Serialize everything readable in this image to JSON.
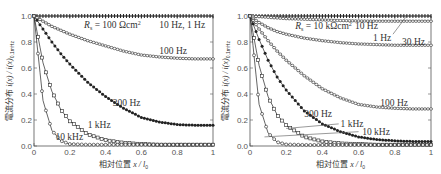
{
  "chart_data": [
    {
      "type": "line",
      "panel": "left",
      "annotation": "R_s = 100 Ωcm²",
      "xlabel": "相対位置 x / l_0",
      "ylabel": "電流分布 i(x) / i(x)_{0.1mHz}",
      "xlim": [
        0,
        1
      ],
      "ylim": [
        0,
        1.0
      ],
      "xticks": [
        "0",
        "0.2",
        "0.4",
        "0.6",
        "0.8",
        "1"
      ],
      "yticks": [
        "0.0",
        "0.2",
        "0.4",
        "0.6",
        "0.8",
        "1.0"
      ],
      "x": [
        0,
        0.05,
        0.1,
        0.15,
        0.2,
        0.3,
        0.4,
        0.5,
        0.6,
        0.7,
        0.8,
        0.9,
        1.0
      ],
      "series": [
        {
          "name": "10 Hz, 1 Hz",
          "marker": "plus",
          "values": [
            1.0,
            1.0,
            1.0,
            1.0,
            1.0,
            1.0,
            1.0,
            1.0,
            1.0,
            1.0,
            1.0,
            1.0,
            1.0
          ]
        },
        {
          "name": "100 Hz",
          "marker": "diamond-open",
          "values": [
            1.0,
            0.96,
            0.92,
            0.89,
            0.86,
            0.81,
            0.77,
            0.73,
            0.7,
            0.685,
            0.675,
            0.67,
            0.67
          ]
        },
        {
          "name": "300 Hz",
          "marker": "circle-filled",
          "values": [
            1.0,
            0.9,
            0.8,
            0.71,
            0.63,
            0.49,
            0.38,
            0.29,
            0.22,
            0.185,
            0.165,
            0.16,
            0.16
          ]
        },
        {
          "name": "1 kHz",
          "marker": "square-open",
          "values": [
            1.0,
            0.64,
            0.42,
            0.28,
            0.19,
            0.09,
            0.045,
            0.025,
            0.015,
            0.01,
            0.01,
            0.01,
            0.01
          ]
        },
        {
          "name": "10 kHz",
          "marker": "circle-open",
          "values": [
            1.0,
            0.35,
            0.12,
            0.04,
            0.015,
            0.01,
            0.01,
            0.01,
            0.01,
            0.01,
            0.01,
            0.01,
            0.01
          ]
        }
      ],
      "labels": [
        {
          "text": "R_s = 100 Ωcm²",
          "x": 0.28,
          "y": 0.93
        },
        {
          "text": "10 Hz, 1 Hz",
          "x": 0.7,
          "y": 0.93
        },
        {
          "text": "100 Hz",
          "x": 0.7,
          "y": 0.73
        },
        {
          "text": "300 Hz",
          "x": 0.44,
          "y": 0.33
        },
        {
          "text": "1 kHz",
          "x": 0.3,
          "y": 0.16
        },
        {
          "text": "10 kHz",
          "x": 0.12,
          "y": 0.07
        }
      ]
    },
    {
      "type": "line",
      "panel": "right",
      "annotation": "R_s = 10 kΩcm²",
      "xlabel": "相対位置 x / l_0",
      "ylabel": "電流分布 i(x) / i(x)_{0.1mHz}",
      "xlim": [
        0,
        1
      ],
      "ylim": [
        0,
        1.0
      ],
      "xticks": [
        "0",
        "0.2",
        "0.4",
        "0.6",
        "0.8",
        "1"
      ],
      "yticks": [
        "0.0",
        "0.2",
        "0.4",
        "0.6",
        "0.8",
        "1.0"
      ],
      "x": [
        0,
        0.05,
        0.1,
        0.15,
        0.2,
        0.3,
        0.4,
        0.5,
        0.6,
        0.7,
        0.8,
        0.9,
        1.0
      ],
      "series": [
        {
          "name": "10 Hz",
          "marker": "plus",
          "values": [
            1.0,
            1.0,
            1.0,
            1.0,
            1.0,
            1.0,
            1.0,
            1.0,
            1.0,
            1.0,
            1.0,
            1.0,
            1.0
          ]
        },
        {
          "name": "1 Hz",
          "marker": "diamond-open",
          "values": [
            1.0,
            0.995,
            0.99,
            0.985,
            0.98,
            0.975,
            0.97,
            0.965,
            0.962,
            0.96,
            0.96,
            0.96,
            0.96
          ]
        },
        {
          "name": "30 Hz",
          "marker": "diamond-open",
          "values": [
            1.0,
            0.95,
            0.91,
            0.88,
            0.86,
            0.83,
            0.81,
            0.795,
            0.785,
            0.78,
            0.775,
            0.775,
            0.775
          ]
        },
        {
          "name": "100 Hz",
          "marker": "diamond-open",
          "values": [
            1.0,
            0.9,
            0.81,
            0.73,
            0.66,
            0.54,
            0.44,
            0.37,
            0.32,
            0.3,
            0.29,
            0.285,
            0.285
          ]
        },
        {
          "name": "300 Hz",
          "marker": "circle-filled",
          "values": [
            1.0,
            0.82,
            0.66,
            0.53,
            0.43,
            0.27,
            0.17,
            0.11,
            0.07,
            0.05,
            0.04,
            0.035,
            0.035
          ]
        },
        {
          "name": "1 kHz",
          "marker": "square-open",
          "values": [
            1.0,
            0.62,
            0.38,
            0.24,
            0.16,
            0.07,
            0.035,
            0.02,
            0.015,
            0.01,
            0.01,
            0.01,
            0.01
          ]
        },
        {
          "name": "10 kHz",
          "marker": "circle-open",
          "values": [
            1.0,
            0.32,
            0.1,
            0.03,
            0.012,
            0.008,
            0.008,
            0.008,
            0.008,
            0.008,
            0.008,
            0.008,
            0.008
          ]
        }
      ],
      "labels": [
        {
          "text": "R_s = 10 kΩcm²",
          "x": 0.25,
          "y": 0.92
        },
        {
          "text": "10 Hz",
          "x": 0.58,
          "y": 0.92
        },
        {
          "text": "1 Hz",
          "x": 0.68,
          "y": 0.83
        },
        {
          "text": "30 Hz",
          "x": 0.84,
          "y": 0.8
        },
        {
          "text": "100 Hz",
          "x": 0.72,
          "y": 0.33
        },
        {
          "text": "300 Hz",
          "x": 0.3,
          "y": 0.25
        },
        {
          "text": "1 kHz",
          "x": 0.5,
          "y": 0.17
        },
        {
          "text": "10 kHz",
          "x": 0.62,
          "y": 0.11
        }
      ]
    }
  ],
  "panels": {
    "left": {
      "rs_label": "R",
      "rs_sub": "s",
      "rs_value": " = 100 Ωcm",
      "rs_sup": "2",
      "labels": [
        "10 Hz, 1 Hz",
        "100 Hz",
        "300 Hz",
        "1 kHz",
        "10 kHz"
      ],
      "xlabel_cjk": "相対位置",
      "xlabel_var": "x / l",
      "xlabel_sub": "0",
      "ylabel_cjk": "電流分布",
      "ylabel_var": "i(x) / i(x)",
      "ylabel_sub": "0.1mHz"
    },
    "right": {
      "rs_label": "R",
      "rs_sub": "s",
      "rs_value": " = 10 kΩcm",
      "rs_sup": "2",
      "labels": [
        "10 Hz",
        "1 Hz",
        "30 Hz",
        "100 Hz",
        "300 Hz",
        "1 kHz",
        "10 kHz"
      ],
      "xlabel_cjk": "相対位置",
      "xlabel_var": "x / l",
      "xlabel_sub": "0",
      "ylabel_cjk": "電流分布",
      "ylabel_var": "i(x) / i(x)",
      "ylabel_sub": "0.1mHz"
    }
  }
}
